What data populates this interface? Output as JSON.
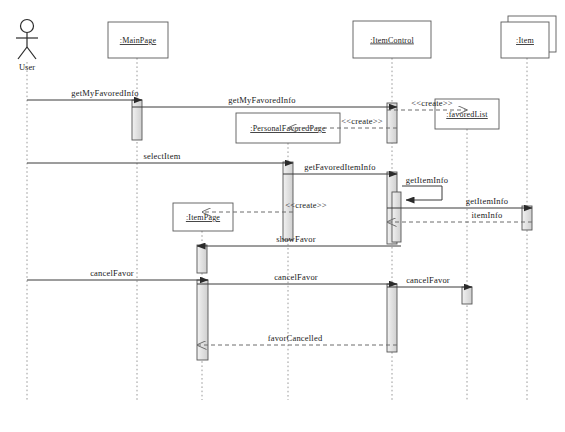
{
  "diagram": {
    "type": "uml-sequence-diagram",
    "title": "",
    "caption": "",
    "actor": {
      "name": "User",
      "icon": "stick-figure-actor-icon"
    },
    "lifelines": [
      {
        "id": "user",
        "label": "User",
        "kind": "actor",
        "x": 27,
        "box": null
      },
      {
        "id": "mainpage",
        "label": ":MainPage",
        "kind": "object",
        "x": 137,
        "box": {
          "x": 108,
          "y": 22,
          "w": 60,
          "h": 36
        }
      },
      {
        "id": "itempage",
        "label": ":ItemPage",
        "kind": "object",
        "x": 202,
        "box": {
          "x": 173,
          "y": 203,
          "w": 60,
          "h": 28
        }
      },
      {
        "id": "personalfav",
        "label": ":PersonalFavoredPage",
        "kind": "object",
        "x": 288,
        "box": {
          "x": 236,
          "y": 113,
          "w": 104,
          "h": 30
        }
      },
      {
        "id": "itemcontrol",
        "label": ":ItemControl",
        "kind": "object",
        "x": 392,
        "box": {
          "x": 353,
          "y": 21,
          "w": 78,
          "h": 37
        }
      },
      {
        "id": "favoredlist",
        "label": ":favoredList",
        "kind": "object",
        "x": 467,
        "box": {
          "x": 435,
          "y": 99,
          "w": 64,
          "h": 30
        }
      },
      {
        "id": "item",
        "label": ":Item",
        "kind": "multiobject",
        "x": 527,
        "box": {
          "x": 501,
          "y": 22,
          "w": 48,
          "h": 36
        }
      }
    ],
    "messages": [
      {
        "id": "m1",
        "label": "getMyFavoredInfo",
        "from": "user",
        "to": "mainpage",
        "y": 100,
        "style": "solid",
        "label_x": 105,
        "label_y": 96
      },
      {
        "id": "m2",
        "label": "getMyFavoredInfo",
        "from": "mainpage",
        "to": "itemcontrol",
        "y": 107,
        "style": "solid",
        "label_x": 262,
        "label_y": 103
      },
      {
        "id": "m3",
        "label": "<<create>>",
        "from": "itemcontrol",
        "to": "favoredlist",
        "y": 110,
        "style": "dashed",
        "label_x": 432,
        "label_y": 106
      },
      {
        "id": "m4",
        "label": "<<create>>",
        "from": "itemcontrol",
        "to": "personalfav",
        "y": 128,
        "style": "dashed",
        "label_x": 362,
        "label_y": 124
      },
      {
        "id": "m5",
        "label": "selectItem",
        "from": "user",
        "to": "personalfav",
        "y": 163,
        "style": "solid",
        "label_x": 162,
        "label_y": 159
      },
      {
        "id": "m6",
        "label": "getFavoredItemInfo",
        "from": "personalfav",
        "to": "itemcontrol",
        "y": 174,
        "style": "solid",
        "label_x": 340,
        "label_y": 170
      },
      {
        "id": "m7",
        "label": "getItemInfo",
        "from": "itemcontrol",
        "to": "itemcontrol",
        "y": 186,
        "style": "self",
        "label_x": 427,
        "label_y": 183
      },
      {
        "id": "m8",
        "label": "getItemInfo",
        "from": "itemcontrol",
        "to": "item",
        "y": 208,
        "style": "solid",
        "label_x": 487,
        "label_y": 204
      },
      {
        "id": "m9",
        "label": "itemInfo",
        "from": "item",
        "to": "itemcontrol",
        "y": 222,
        "style": "dashed",
        "label_x": 487,
        "label_y": 218
      },
      {
        "id": "m10",
        "label": "<<create>>",
        "from": "personalfav",
        "to": "itempage",
        "y": 212,
        "style": "dashed",
        "label_x": 306,
        "label_y": 208
      },
      {
        "id": "m11",
        "label": "showFavor",
        "from": "itemcontrol",
        "to": "itempage",
        "y": 246,
        "style": "solid",
        "label_x": 296,
        "label_y": 242
      },
      {
        "id": "m12",
        "label": "cancelFavor",
        "from": "user",
        "to": "itempage",
        "y": 280,
        "style": "solid",
        "label_x": 112,
        "label_y": 276
      },
      {
        "id": "m13",
        "label": "cancelFavor",
        "from": "itempage",
        "to": "itemcontrol",
        "y": 284,
        "style": "solid",
        "label_x": 296,
        "label_y": 280
      },
      {
        "id": "m14",
        "label": "cancelFavor",
        "from": "itemcontrol",
        "to": "favoredlist",
        "y": 287,
        "style": "solid",
        "label_x": 428,
        "label_y": 283
      },
      {
        "id": "m15",
        "label": "favorCancelled",
        "from": "itemcontrol",
        "to": "itempage",
        "y": 345,
        "style": "dashed",
        "label_x": 295,
        "label_y": 341
      }
    ],
    "activations": [
      {
        "id": "a1",
        "lifeline": "mainpage",
        "x": 132,
        "y": 100,
        "w": 10,
        "h": 40
      },
      {
        "id": "a2",
        "lifeline": "itemcontrol",
        "x": 387,
        "y": 103,
        "w": 10,
        "h": 40
      },
      {
        "id": "a3",
        "lifeline": "personalfav",
        "x": 283,
        "y": 162,
        "w": 10,
        "h": 78
      },
      {
        "id": "a4",
        "lifeline": "itemcontrol",
        "x": 387,
        "y": 172,
        "w": 10,
        "h": 72
      },
      {
        "id": "a5",
        "lifeline": "itemcontrol",
        "x": 392,
        "y": 192,
        "w": 9,
        "h": 50
      },
      {
        "id": "a6",
        "lifeline": "item",
        "x": 522,
        "y": 206,
        "w": 10,
        "h": 24
      },
      {
        "id": "a7",
        "lifeline": "itempage",
        "x": 197,
        "y": 245,
        "w": 10,
        "h": 28
      },
      {
        "id": "a8",
        "lifeline": "itempage",
        "x": 197,
        "y": 280,
        "w": 11,
        "h": 80
      },
      {
        "id": "a9",
        "lifeline": "itemcontrol",
        "x": 387,
        "y": 284,
        "w": 10,
        "h": 68
      },
      {
        "id": "a10",
        "lifeline": "favoredlist",
        "x": 462,
        "y": 287,
        "w": 10,
        "h": 17
      }
    ],
    "colors": {
      "line": "#3a3a3a",
      "box_fill": "#ffffff",
      "box_stroke": "#5a5a5a",
      "activation_fill": "#e4e4e4",
      "activation_stroke": "#555555",
      "lifeline_dash": "#9a9a9a",
      "text": "#1a1a1a"
    }
  }
}
